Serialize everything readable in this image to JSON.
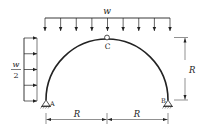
{
  "diagram": {
    "type": "three-hinged semicircular arch",
    "labels": {
      "top_load": "w",
      "side_load_numerator": "w",
      "side_load_denominator": "2",
      "hinge_top": "C",
      "support_left": "A",
      "support_right": "B",
      "height_dim": "R",
      "span_left_dim": "R",
      "span_right_dim": "R"
    },
    "top_load_arrow_count": 9,
    "side_load_arrow_count": 5,
    "colors": {
      "stroke": "#222222",
      "background": "#ffffff"
    }
  }
}
